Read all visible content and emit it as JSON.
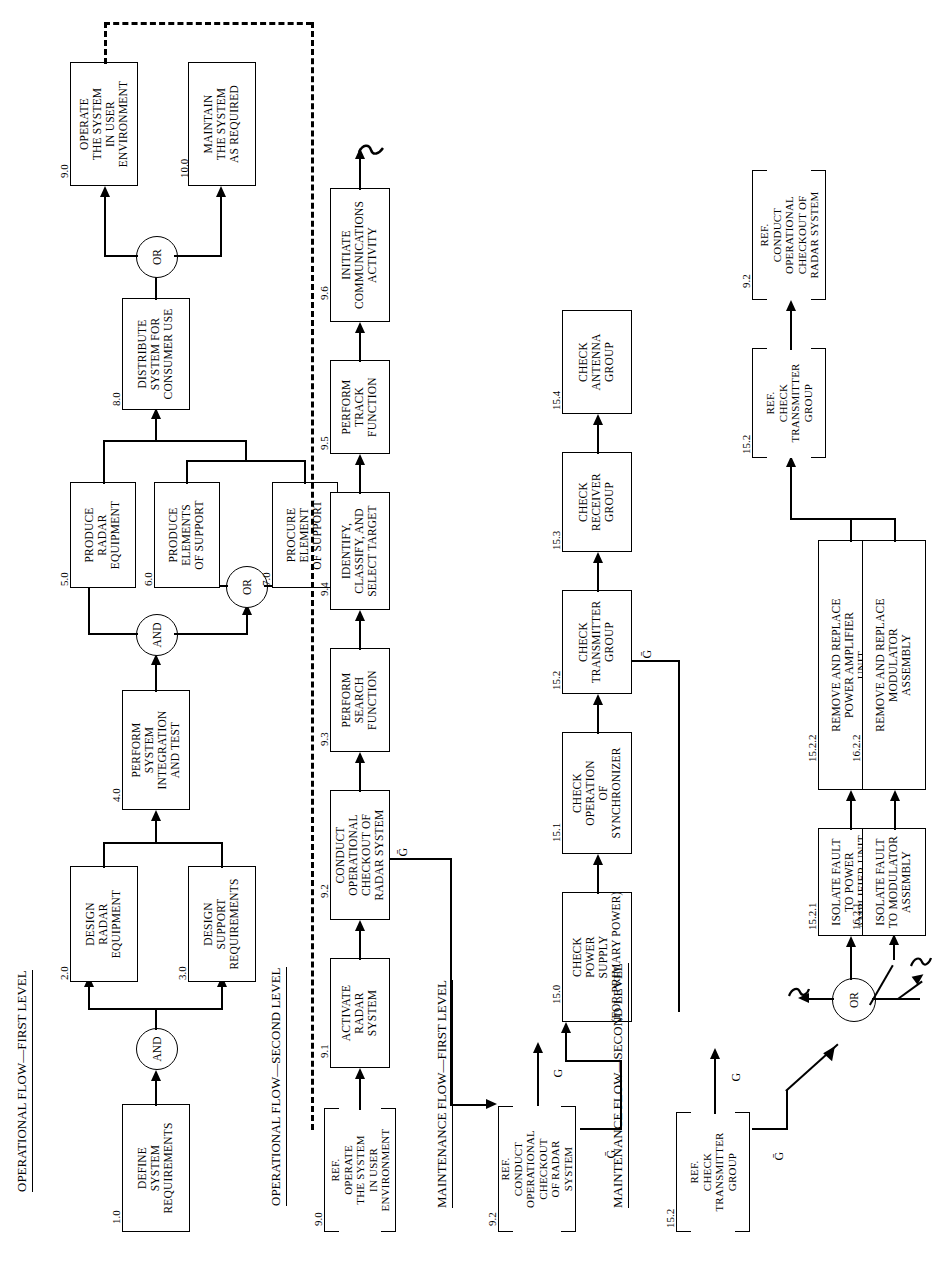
{
  "diagram": {
    "sections": [
      {
        "id": "sec-op-first",
        "label": "OPERATIONAL FLOW—FIRST LEVEL"
      },
      {
        "id": "sec-op-second",
        "label": "OPERATIONAL FLOW—SECOND LEVEL"
      },
      {
        "id": "sec-mt-first",
        "label": "MAINTENANCE FLOW—FIRST LEVEL"
      },
      {
        "id": "sec-mt-second",
        "label": "MAINTENANCE FLOW—SECOND LEVEL"
      }
    ],
    "gates": {
      "and": "AND",
      "or": "OR"
    },
    "ref_prefix": "REF.",
    "signals": {
      "go": "G",
      "nogo": "Ḡ"
    },
    "blocks": {
      "b1": {
        "num": "1.0",
        "text": "DEFINE\nSYSTEM\nREQUIREMENTS"
      },
      "b2": {
        "num": "2.0",
        "text": "DESIGN\nRADAR\nEQUIPMENT"
      },
      "b3": {
        "num": "3.0",
        "text": "DESIGN\nSUPPORT\nREQUIREMENTS"
      },
      "b4": {
        "num": "4.0",
        "text": "PERFORM\nSYSTEM\nINTEGRATION\nAND TEST"
      },
      "b5": {
        "num": "5.0",
        "text": "PRODUCE\nRADAR\nEQUIPMENT"
      },
      "b6": {
        "num": "6.0",
        "text": "PRODUCE\nELEMENTS\nOF SUPPORT"
      },
      "b7": {
        "num": "7.0",
        "text": "PROCURE\nELEMENT\nOF SUPPORT"
      },
      "b8": {
        "num": "8.0",
        "text": "DISTRIBUTE\nSYSTEM FOR\nCONSUMER USE"
      },
      "b9": {
        "num": "9.0",
        "text": "OPERATE\nTHE SYSTEM\nIN USER\nENVIRONMENT"
      },
      "b10": {
        "num": "10.0",
        "text": "MAINTAIN\nTHE SYSTEM\nAS REQUIRED"
      },
      "r90": {
        "num": "9.0",
        "text": "OPERATE\nTHE SYSTEM\nIN USER\nENVIRONMENT"
      },
      "b91": {
        "num": "9.1",
        "text": "ACTIVATE\nRADAR\nSYSTEM"
      },
      "b92": {
        "num": "9.2",
        "text": "CONDUCT\nOPERATIONAL\nCHECKOUT OF\nRADAR SYSTEM"
      },
      "b93": {
        "num": "9.3",
        "text": "PERFORM\nSEARCH\nFUNCTION"
      },
      "b94": {
        "num": "9.4",
        "text": "IDENTIFY,\nCLASSIFY, AND\nSELECT TARGET"
      },
      "b95": {
        "num": "9.5",
        "text": "PERFORM\nTRACK\nFUNCTION"
      },
      "b96": {
        "num": "9.6",
        "text": "INITIATE\nCOMMUNICATIONS\nACTIVITY"
      },
      "r92": {
        "num": "9.2",
        "text": "CONDUCT\nOPERATIONAL\nCHECKOUT\nOF RADAR\nSYSTEM"
      },
      "b150": {
        "num": "15.0",
        "text": "CHECK\nPOWER\nSUPPLY\n(FOR PRIMARY POWER)"
      },
      "b151": {
        "num": "15.1",
        "text": "CHECK\nOPERATION\nOF\nSYNCHRONIZER"
      },
      "b152": {
        "num": "15.2",
        "text": "CHECK\nTRANSMITTER\nGROUP"
      },
      "b153": {
        "num": "15.3",
        "text": "CHECK\nRECEIVER\nGROUP"
      },
      "b154": {
        "num": "15.4",
        "text": "CHECK\nANTENNA\nGROUP"
      },
      "r152": {
        "num": "15.2",
        "text": "CHECK\nTRANSMITTER\nGROUP"
      },
      "b1521": {
        "num": "15.2.1",
        "text": "ISOLATE FAULT\nTO POWER\nAMPLIFIER UNIT"
      },
      "b1621": {
        "num": "16.2.1",
        "text": "ISOLATE FAULT\nTO MODULATOR\nASSEMBLY"
      },
      "b1522": {
        "num": "15.2.2",
        "text": "REMOVE AND REPLACE\nPOWER AMPLIFIER\nUNIT"
      },
      "b1622": {
        "num": "16.2.2",
        "text": "REMOVE AND REPLACE\nMODULATOR\nASSEMBLY"
      },
      "r152b": {
        "num": "15.2",
        "text": "CHECK\nTRANSMITTER\nGROUP"
      },
      "r92b": {
        "num": "9.2",
        "text": "CONDUCT\nOPERATIONAL\nCHECKOUT OF\nRADAR SYSTEM"
      }
    }
  }
}
